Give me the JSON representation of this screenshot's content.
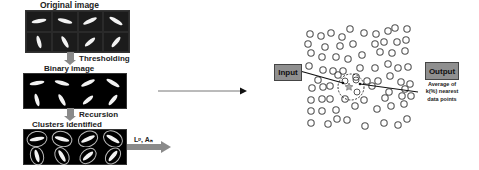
{
  "left_pipeline": {
    "stages": [
      {
        "label": "Original image"
      },
      {
        "label": "Binary image"
      },
      {
        "label": "Clusters identified"
      }
    ],
    "steps": [
      {
        "label": "Thresholding"
      },
      {
        "label": "Recursion"
      }
    ],
    "output_label": "Lᵖ, Aₙ"
  },
  "knn": {
    "input_label": "Input",
    "output_label": "Output",
    "output_note_lines": [
      "Average of",
      "k(%) nearest",
      "data points"
    ],
    "query_marker": "star-icon",
    "colors": {
      "box_fill": "#8f8f8f",
      "circle_stroke": "#555555",
      "line": "#111111"
    }
  }
}
